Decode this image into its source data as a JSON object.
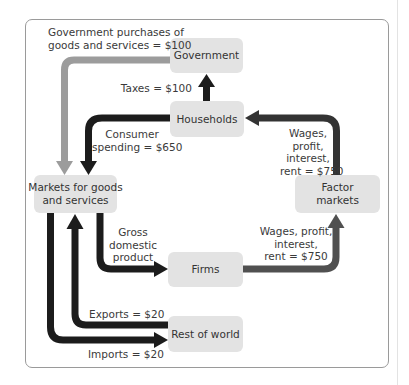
{
  "diagram": {
    "type": "circular-flow",
    "nodes": {
      "government": "Government",
      "households": "Households",
      "markets_goods_services": "Markets for goods\nand services",
      "factor_markets": "Factor\nmarkets",
      "firms": "Firms",
      "rest_of_world": "Rest of world"
    },
    "flows": {
      "government_purchases": "Government purchases of\ngoods and services = $100",
      "taxes": "Taxes = $100",
      "consumer_spending": "Consumer\nspending = $650",
      "wages_to_households": "Wages,\nprofit,\ninterest,\nrent = $750",
      "wages_from_firms": "Wages, profit,\ninterest,\nrent = $750",
      "gdp": "Gross\ndomestic\nproduct",
      "exports": "Exports = $20",
      "imports": "Imports = $20"
    },
    "colors": {
      "dark_arrow": "#1c1c1c",
      "mid_arrow": "#4a4a4a",
      "gray_arrow": "#9c9c9c",
      "box_fill": "#e3e3e3",
      "frame": "#9a9a9a"
    }
  }
}
